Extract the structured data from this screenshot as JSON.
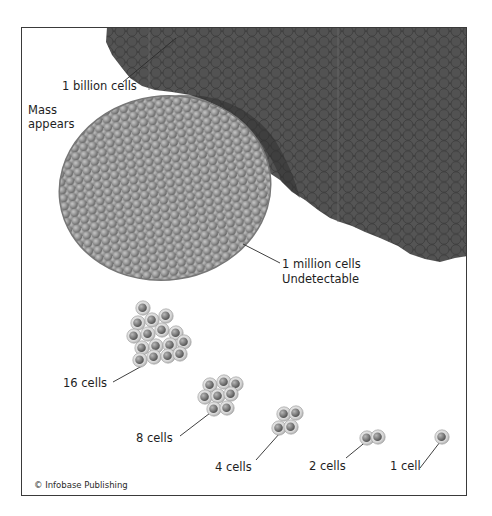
{
  "figure": {
    "colors": {
      "billion_mass": "#4b4b4b",
      "billion_cell_outline": "#3a3a3a",
      "million_mass": "#8e8e8e",
      "million_cell_highlight": "#b5b5b5",
      "cell_body": "#d9d9d9",
      "cell_nucleus": "#7a7a7a",
      "frame": "#3a3a3a",
      "text": "#1e1e1e"
    },
    "labels": {
      "billion": "1 billion cells",
      "mass_line1": "Mass",
      "mass_line2": "appears",
      "million_line1": "1 million cells",
      "million_line2": "Undetectable",
      "sixteen": "16 cells",
      "eight": "8 cells",
      "four": "4 cells",
      "two": "2 cells",
      "one": "1 cell"
    },
    "credit": "© Infobase Publishing",
    "stages": [
      {
        "cells": "1 cell"
      },
      {
        "cells": "2 cells"
      },
      {
        "cells": "4 cells"
      },
      {
        "cells": "8 cells"
      },
      {
        "cells": "16 cells"
      },
      {
        "cells": "1 million cells",
        "note": "Undetectable"
      },
      {
        "cells": "1 billion cells",
        "note": "Mass appears"
      }
    ]
  }
}
